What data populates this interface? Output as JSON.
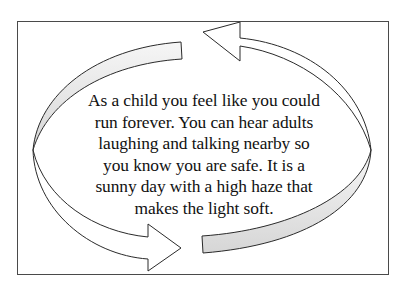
{
  "diagram": {
    "type": "cycle",
    "arrows": [
      {
        "name": "top-arrow",
        "direction": "counter-clockwise",
        "points_to": "top-left"
      },
      {
        "name": "bottom-arrow",
        "direction": "counter-clockwise",
        "points_to": "bottom-right"
      }
    ],
    "colors": {
      "border": "#4a4a4a",
      "arrow_stroke": "#2a2a2a",
      "arrow_fill": "#ffffff",
      "band_fill_light": "#f4f4f4",
      "band_fill_dark": "#d9d9d9",
      "text": "#111111"
    }
  },
  "caption": {
    "lines": [
      "As a child you feel like you could",
      "run forever. You can hear adults",
      "laughing and talking nearby so",
      "you know you are safe. It is a",
      "sunny day with a high haze that",
      "makes the light soft."
    ]
  }
}
